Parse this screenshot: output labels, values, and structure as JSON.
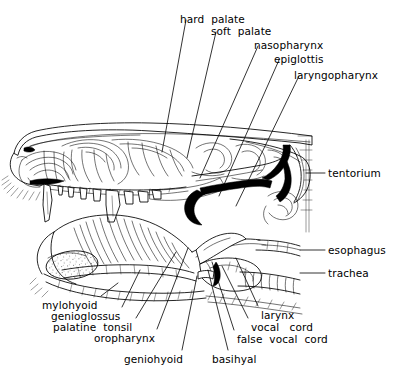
{
  "figure": {
    "width": 400,
    "height": 381,
    "background_color": "#ffffff",
    "ink_color": "#000000",
    "label_font_size_px": 10.5
  },
  "labels": [
    {
      "id": "hard-palate",
      "text": "hard  palate",
      "x": 180,
      "y": 14,
      "anchor": "start"
    },
    {
      "id": "soft-palate",
      "text": "soft  palate",
      "x": 211,
      "y": 26,
      "anchor": "start"
    },
    {
      "id": "nasopharynx",
      "text": "nasopharynx",
      "x": 254,
      "y": 40,
      "anchor": "start"
    },
    {
      "id": "epiglottis",
      "text": "epiglottis",
      "x": 274,
      "y": 54,
      "anchor": "start"
    },
    {
      "id": "laryngopharynx",
      "text": "laryngopharynx",
      "x": 294,
      "y": 70,
      "anchor": "start"
    },
    {
      "id": "tentorium",
      "text": "tentorium",
      "x": 328,
      "y": 168,
      "anchor": "start"
    },
    {
      "id": "esophagus",
      "text": "esophagus",
      "x": 328,
      "y": 245,
      "anchor": "start"
    },
    {
      "id": "trachea",
      "text": "trachea",
      "x": 328,
      "y": 268,
      "anchor": "start"
    },
    {
      "id": "mylohyoid",
      "text": "mylohyoid",
      "x": 42,
      "y": 300,
      "anchor": "start"
    },
    {
      "id": "genioglossus",
      "text": "genioglossus",
      "x": 51,
      "y": 311,
      "anchor": "start"
    },
    {
      "id": "palatine-tonsil",
      "text": "palatine  tonsil",
      "x": 53,
      "y": 322,
      "anchor": "start"
    },
    {
      "id": "oropharynx",
      "text": "oropharynx",
      "x": 94,
      "y": 333,
      "anchor": "start"
    },
    {
      "id": "geniohyoid",
      "text": "geniohyoid",
      "x": 124,
      "y": 354,
      "anchor": "start"
    },
    {
      "id": "basihyal",
      "text": "basihyal",
      "x": 212,
      "y": 354,
      "anchor": "start"
    },
    {
      "id": "larynx",
      "text": "larynx",
      "x": 261,
      "y": 310,
      "anchor": "start"
    },
    {
      "id": "vocal-cord",
      "text": "vocal   cord",
      "x": 251,
      "y": 322,
      "anchor": "start"
    },
    {
      "id": "false-vocal-cord",
      "text": "false  vocal  cord",
      "x": 237,
      "y": 334,
      "anchor": "start"
    }
  ],
  "leader_lines": [
    {
      "id": "leader-hard-palate",
      "for": "hard-palate",
      "points": "186,20 162,152"
    },
    {
      "id": "leader-soft-palate",
      "for": "soft-palate",
      "points": "216,32 187,158"
    },
    {
      "id": "leader-nasopharynx",
      "for": "nasopharynx",
      "points": "258,46 200,178"
    },
    {
      "id": "leader-epiglottis",
      "for": "epiglottis",
      "points": "279,60 219,196"
    },
    {
      "id": "leader-laryngopharynx",
      "for": "laryngopharynx",
      "points": "299,76 236,206"
    },
    {
      "id": "leader-tentorium",
      "for": "tentorium",
      "points": "325,173 306,173"
    },
    {
      "id": "leader-esophagus",
      "for": "esophagus",
      "points": "325,250 300,250"
    },
    {
      "id": "leader-trachea",
      "for": "trachea",
      "points": "325,273 300,273"
    },
    {
      "id": "leader-mylohyoid",
      "for": "mylohyoid",
      "points": "101,296 118,283"
    },
    {
      "id": "leader-genioglossus",
      "for": "genioglossus",
      "points": "122,307 140,270"
    },
    {
      "id": "leader-palatine-tonsil",
      "for": "palatine-tonsil",
      "points": "136,318 176,252"
    },
    {
      "id": "leader-oropharynx",
      "for": "oropharynx",
      "points": "157,329 188,248"
    },
    {
      "id": "leader-geniohyoid",
      "for": "geniohyoid",
      "points": "182,350 197,276"
    },
    {
      "id": "leader-basihyal",
      "for": "basihyal",
      "points": "228,350 208,270"
    },
    {
      "id": "leader-false-vocal-cord",
      "for": "false-vocal-cord",
      "points": "234,330 212,262"
    },
    {
      "id": "leader-vocal-cord",
      "for": "vocal-cord",
      "points": "248,318 222,266"
    },
    {
      "id": "leader-larynx",
      "for": "larynx",
      "points": "258,306 236,258"
    }
  ],
  "anatomy_parts": [
    "nose",
    "nasal-turbinates",
    "hard-palate",
    "soft-palate",
    "nasopharynx",
    "tentorium",
    "epiglottis",
    "laryngopharynx",
    "esophagus",
    "trachea",
    "tongue",
    "mylohyoid",
    "genioglossus",
    "geniohyoid",
    "palatine-tonsil",
    "oropharynx",
    "basihyal",
    "larynx",
    "vocal-cord",
    "false-vocal-cord",
    "upper-teeth",
    "canine-tooth",
    "lower-jaw",
    "brain-cavity"
  ]
}
